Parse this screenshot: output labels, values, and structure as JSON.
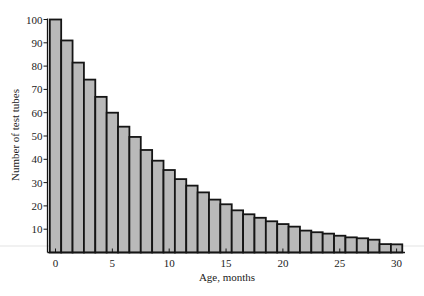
{
  "chart_data": {
    "type": "bar",
    "title": "",
    "xlabel": "Age, months",
    "ylabel": "Number of test tubes",
    "categories": [
      0,
      1,
      2,
      3,
      4,
      5,
      6,
      7,
      8,
      9,
      10,
      11,
      12,
      13,
      14,
      15,
      16,
      17,
      18,
      19,
      20,
      21,
      22,
      23,
      24,
      25,
      26,
      27,
      28,
      29,
      30
    ],
    "values": [
      100,
      91,
      81.5,
      74.2,
      66.8,
      60,
      54,
      49.6,
      44,
      39.4,
      35.4,
      31.5,
      28.7,
      25.8,
      22.7,
      20.7,
      18.1,
      16.4,
      14.9,
      13.4,
      12.2,
      11.1,
      9.4,
      8.7,
      8.1,
      7.2,
      6.5,
      6.1,
      5.5,
      3.6,
      3.5
    ],
    "xticks": [
      0,
      5,
      10,
      15,
      20,
      25,
      30
    ],
    "yticks": [
      10,
      20,
      30,
      40,
      50,
      60,
      70,
      80,
      90,
      100
    ],
    "xlim": [
      -0.7,
      31.4
    ],
    "ylim": [
      0,
      100
    ],
    "grid": false,
    "legend": null,
    "colors": {
      "bar_fill": "#b9b9b9",
      "bar_edge": "#151515"
    }
  },
  "labels": {
    "xlabel": "Age, months",
    "ylabel": "Number of test tubes"
  }
}
